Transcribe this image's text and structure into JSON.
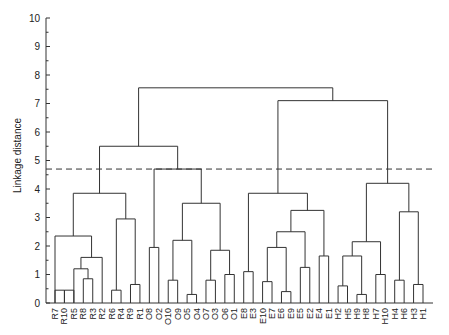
{
  "chart_data": {
    "type": "dendrogram",
    "title": "",
    "xlabel": "",
    "ylabel": "Linkage distance",
    "ylim": [
      0,
      10
    ],
    "yticks": [
      0,
      1,
      2,
      3,
      4,
      5,
      6,
      7,
      8,
      9,
      10
    ],
    "cut_line": 4.7,
    "leaves": [
      "R7",
      "R10",
      "R5",
      "R8",
      "R3",
      "R2",
      "R6",
      "R4",
      "R9",
      "R1",
      "O8",
      "O2",
      "O10",
      "O9",
      "O5",
      "O4",
      "O7",
      "O3",
      "O6",
      "O1",
      "E8",
      "E3",
      "E10",
      "E7",
      "E6",
      "E9",
      "E5",
      "E2",
      "E4",
      "E1",
      "H2",
      "H5",
      "H9",
      "H8",
      "H7",
      "H10",
      "H4",
      "H6",
      "H3",
      "H1"
    ],
    "merges": [
      {
        "a": "L0",
        "b": "L1",
        "h": 0.45,
        "id": "c1"
      },
      {
        "a": "L1",
        "b": "L2",
        "h": 0.45,
        "id": "c1b"
      },
      {
        "a": "L3",
        "b": "L4",
        "h": 0.85,
        "id": "c2"
      },
      {
        "a": "L2",
        "b": "c2",
        "h": 1.2,
        "id": "c3"
      },
      {
        "a": "c3",
        "b": "L5",
        "h": 1.6,
        "id": "c4"
      },
      {
        "a": "L0",
        "b": "c4",
        "h": 2.35,
        "id": "c5"
      },
      {
        "a": "L6",
        "b": "L7",
        "h": 0.45,
        "id": "c6"
      },
      {
        "a": "L8",
        "b": "L9",
        "h": 0.65,
        "id": "c7"
      },
      {
        "a": "c6",
        "b": "c7",
        "h": 2.95,
        "id": "c8"
      },
      {
        "a": "c5",
        "b": "c8",
        "h": 3.85,
        "id": "c9"
      },
      {
        "a": "L10",
        "b": "L11",
        "h": 1.95,
        "id": "c10"
      },
      {
        "a": "L12",
        "b": "L13",
        "h": 0.8,
        "id": "c11"
      },
      {
        "a": "L14",
        "b": "L15",
        "h": 0.3,
        "id": "c12"
      },
      {
        "a": "c11",
        "b": "c12",
        "h": 2.2,
        "id": "c13"
      },
      {
        "a": "L16",
        "b": "L17",
        "h": 0.8,
        "id": "c14"
      },
      {
        "a": "L18",
        "b": "L19",
        "h": 1.0,
        "id": "c15"
      },
      {
        "a": "c14",
        "b": "c15",
        "h": 1.85,
        "id": "c16"
      },
      {
        "a": "c13",
        "b": "c16",
        "h": 3.5,
        "id": "c17"
      },
      {
        "a": "c10",
        "b": "c17",
        "h": 4.7,
        "id": "c18"
      },
      {
        "a": "c9",
        "b": "c18",
        "h": 5.5,
        "id": "c19"
      },
      {
        "a": "L20",
        "b": "L21",
        "h": 1.1,
        "id": "c20"
      },
      {
        "a": "L22",
        "b": "L23",
        "h": 0.75,
        "id": "c21"
      },
      {
        "a": "L24",
        "b": "L25",
        "h": 0.4,
        "id": "c22"
      },
      {
        "a": "c21",
        "b": "c22",
        "h": 1.95,
        "id": "c23"
      },
      {
        "a": "L26",
        "b": "L27",
        "h": 1.25,
        "id": "c24"
      },
      {
        "a": "c23",
        "b": "c24",
        "h": 2.5,
        "id": "c25"
      },
      {
        "a": "L28",
        "b": "L29",
        "h": 1.65,
        "id": "c26"
      },
      {
        "a": "c25",
        "b": "c26",
        "h": 3.25,
        "id": "c27"
      },
      {
        "a": "c20",
        "b": "c27",
        "h": 3.85,
        "id": "c28"
      },
      {
        "a": "L30",
        "b": "L31",
        "h": 0.6,
        "id": "c29"
      },
      {
        "a": "L32",
        "b": "L33",
        "h": 0.3,
        "id": "c30"
      },
      {
        "a": "c29",
        "b": "c30",
        "h": 1.65,
        "id": "c31"
      },
      {
        "a": "L34",
        "b": "L35",
        "h": 1.0,
        "id": "c32"
      },
      {
        "a": "c31",
        "b": "c32",
        "h": 2.15,
        "id": "c33"
      },
      {
        "a": "L36",
        "b": "L37",
        "h": 0.8,
        "id": "c34"
      },
      {
        "a": "L38",
        "b": "L39",
        "h": 0.65,
        "id": "c35"
      },
      {
        "a": "c34",
        "b": "c35",
        "h": 3.2,
        "id": "c36"
      },
      {
        "a": "c33",
        "b": "c36",
        "h": 4.2,
        "id": "c37"
      },
      {
        "a": "c28",
        "b": "c37",
        "h": 7.1,
        "id": "c38"
      },
      {
        "a": "c19",
        "b": "c38",
        "h": 7.55,
        "id": "c39"
      }
    ]
  }
}
